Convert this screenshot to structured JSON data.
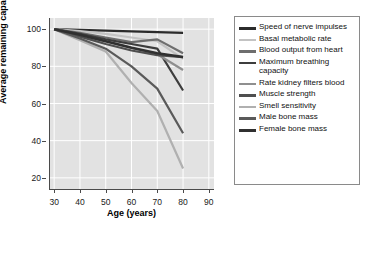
{
  "chart_data": {
    "type": "line",
    "title": "",
    "xlabel": "Age (years)",
    "ylabel": "Average remaining capacity (%)",
    "xlim": [
      28,
      92
    ],
    "ylim": [
      14,
      106
    ],
    "xticks": [
      30,
      40,
      50,
      60,
      70,
      80,
      90
    ],
    "yticks": [
      20,
      40,
      60,
      80,
      100
    ],
    "grid": true,
    "grid_color": "#ffffff",
    "plot_background": "#e2e2e2",
    "legend_position": "right",
    "x": [
      30,
      40,
      50,
      60,
      70,
      80
    ],
    "series": [
      {
        "name": "Speed of nerve impulses",
        "color": "#2b2b2b",
        "width": 2.2,
        "values": [
          100,
          99.6,
          99.2,
          98.8,
          98.4,
          98
        ]
      },
      {
        "name": "Basal metabolic rate",
        "color": "#c3c3c3",
        "width": 2.2,
        "values": [
          100,
          99,
          97.5,
          95.5,
          93.5,
          84
        ]
      },
      {
        "name": "Blood output from heart",
        "color": "#6e6e6e",
        "width": 2.2,
        "values": [
          100,
          98,
          95.5,
          93,
          94.5,
          87
        ]
      },
      {
        "name": "Maximum breathing capacity",
        "color": "#3d3d3d",
        "width": 2.2,
        "values": [
          100,
          97.5,
          94.5,
          92,
          89.5,
          67
        ]
      },
      {
        "name": "Rate kidney filters blood",
        "color": "#8f8f8f",
        "width": 2.2,
        "values": [
          100,
          96.5,
          93.5,
          90,
          86.5,
          78
        ]
      },
      {
        "name": "Muscle strength",
        "color": "#4f4f4f",
        "width": 2.2,
        "values": [
          100,
          96,
          92,
          88.5,
          86,
          85
        ]
      },
      {
        "name": "Smell sensitivity",
        "color": "#b0b0b0",
        "width": 2.2,
        "values": [
          100,
          94,
          88,
          71,
          56,
          25
        ]
      },
      {
        "name": "Male bone mass",
        "color": "#5a5a5a",
        "width": 2.2,
        "values": [
          100,
          95,
          89.5,
          80,
          68,
          44
        ]
      },
      {
        "name": "Female bone mass",
        "color": "#303030",
        "width": 2.6,
        "values": [
          100,
          97,
          93.5,
          90,
          87,
          85
        ]
      }
    ]
  },
  "legend": {
    "items": [
      {
        "label": "Speed of nerve impulses",
        "color": "#2b2b2b",
        "thickness": 2.6
      },
      {
        "label": "Basal metabolic rate",
        "color": "#c3c3c3",
        "thickness": 2.6
      },
      {
        "label": "Blood output from heart",
        "color": "#6e6e6e",
        "thickness": 2.6
      },
      {
        "label": "Maximum breathing capacity",
        "color": "#3d3d3d",
        "thickness": 2.6
      },
      {
        "label": "Rate kidney filters blood",
        "color": "#8f8f8f",
        "thickness": 2.6
      },
      {
        "label": "Muscle strength",
        "color": "#4f4f4f",
        "thickness": 2.8
      },
      {
        "label": "Smell sensitivity",
        "color": "#b0b0b0",
        "thickness": 2.6
      },
      {
        "label": "Male bone mass",
        "color": "#5a5a5a",
        "thickness": 2.8
      },
      {
        "label": "Female bone mass",
        "color": "#303030",
        "thickness": 3.0
      }
    ]
  }
}
